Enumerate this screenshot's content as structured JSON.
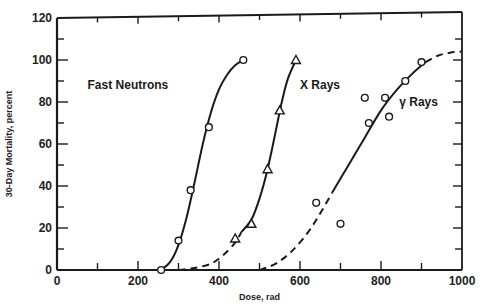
{
  "chart_data": {
    "type": "line",
    "title": "",
    "xlabel": "Dose, rad",
    "ylabel": "30-Day Mortality, percent",
    "xlim": [
      0,
      1000
    ],
    "ylim": [
      0,
      120
    ],
    "x_ticks": [
      0,
      200,
      400,
      600,
      800,
      1000
    ],
    "y_ticks": [
      0,
      20,
      40,
      60,
      80,
      100,
      120
    ],
    "x_minor_step": 100,
    "y_minor_step": 10,
    "grid": false,
    "legend": "inline labels",
    "series": [
      {
        "name": "Fast Neutrons",
        "marker": "circle",
        "line": "solid",
        "points": [
          [
            257,
            0
          ],
          [
            300,
            14
          ],
          [
            330,
            38
          ],
          [
            375,
            68
          ],
          [
            460,
            100
          ]
        ],
        "curve": [
          [
            257,
            0
          ],
          [
            280,
            4
          ],
          [
            300,
            12
          ],
          [
            320,
            25
          ],
          [
            340,
            42
          ],
          [
            360,
            60
          ],
          [
            380,
            75
          ],
          [
            400,
            86
          ],
          [
            420,
            93
          ],
          [
            440,
            97.5
          ],
          [
            460,
            100
          ]
        ],
        "dashed_curve": []
      },
      {
        "name": "X Rays",
        "marker": "triangle",
        "line": "solid+dashed",
        "points": [
          [
            440,
            15
          ],
          [
            480,
            22
          ],
          [
            520,
            48
          ],
          [
            550,
            76
          ],
          [
            590,
            100
          ]
        ],
        "curve": [
          [
            455,
            18
          ],
          [
            480,
            24
          ],
          [
            500,
            34
          ],
          [
            520,
            48
          ],
          [
            540,
            66
          ],
          [
            555,
            80
          ],
          [
            570,
            91
          ],
          [
            590,
            100
          ]
        ],
        "dashed_curve": [
          [
            300,
            0
          ],
          [
            340,
            1
          ],
          [
            380,
            3
          ],
          [
            410,
            7
          ],
          [
            440,
            13
          ],
          [
            455,
            18
          ]
        ]
      },
      {
        "name": "γ Rays",
        "marker": "circle",
        "line": "solid+dashed",
        "points": [
          [
            640,
            32
          ],
          [
            700,
            22
          ],
          [
            760,
            82
          ],
          [
            770,
            70
          ],
          [
            810,
            82
          ],
          [
            820,
            73
          ],
          [
            860,
            90
          ],
          [
            900,
            99
          ]
        ],
        "curve": [
          [
            680,
            37
          ],
          [
            720,
            50
          ],
          [
            760,
            63
          ],
          [
            800,
            76
          ],
          [
            840,
            86
          ],
          [
            880,
            94
          ],
          [
            910,
            99
          ]
        ],
        "dashed_curve": [
          [
            500,
            0
          ],
          [
            540,
            3
          ],
          [
            580,
            9
          ],
          [
            620,
            18
          ],
          [
            650,
            27
          ],
          [
            680,
            37
          ]
        ],
        "dashed_tail": [
          [
            910,
            99
          ],
          [
            940,
            102
          ],
          [
            970,
            103.5
          ],
          [
            1000,
            104
          ]
        ]
      }
    ],
    "annotations": [
      {
        "text": "Fast Neutrons",
        "x": 175,
        "y": 88
      },
      {
        "text": "X Rays",
        "x": 600,
        "y": 88
      },
      {
        "text": "γ Rays",
        "x": 845,
        "y": 80
      }
    ]
  }
}
